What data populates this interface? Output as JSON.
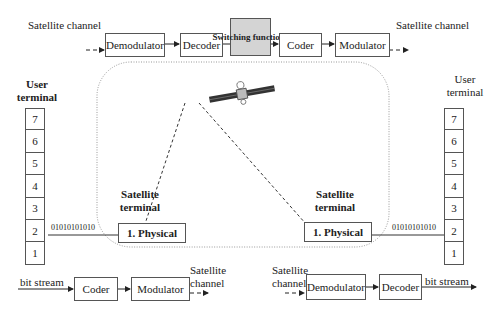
{
  "top_chain": {
    "in_label": "Satellite channel",
    "blocks": [
      "Demodulator",
      "Decoder",
      "Switching functions",
      "Coder",
      "Modulator"
    ],
    "out_label": "Satellite channel"
  },
  "left_terminal": {
    "title": "User terminal",
    "layers": [
      "7",
      "6",
      "5",
      "4",
      "3",
      "2",
      "1"
    ],
    "bits": "01010101010"
  },
  "right_terminal": {
    "title": "User terminal",
    "layers": [
      "7",
      "6",
      "5",
      "4",
      "3",
      "2",
      "1"
    ],
    "bits": "01010101010"
  },
  "satellite_terminals": {
    "left": {
      "title": "Satellite terminal",
      "layer": "1. Physical"
    },
    "right": {
      "title": "Satellite terminal",
      "layer": "1. Physical"
    }
  },
  "bottom_left_chain": {
    "in_label": "bit stream",
    "blocks": [
      "Coder",
      "Modulator"
    ],
    "out_label": "Satellite channel"
  },
  "bottom_right_chain": {
    "in_label": "Satellite channel",
    "blocks": [
      "Demodulator",
      "Decoder"
    ],
    "out_label": "bit stream"
  },
  "icons": {
    "satellite": "satellite-icon"
  }
}
